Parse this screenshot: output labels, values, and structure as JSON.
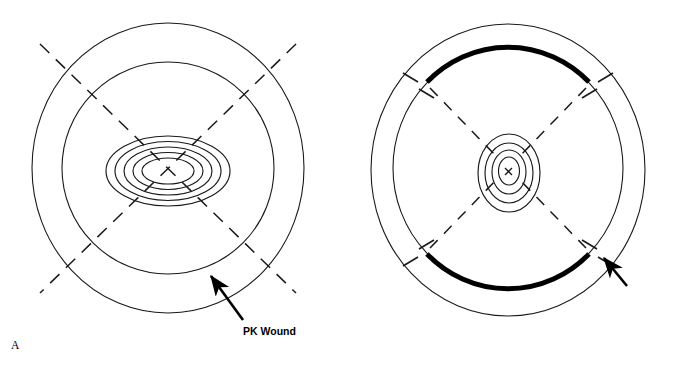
{
  "figure": {
    "width": 682,
    "height": 370,
    "background": "#ffffff",
    "stroke_color": "#1a1a1a",
    "accent_color": "#000000"
  },
  "panels": [
    {
      "id": "A",
      "letter": "A",
      "callout_label": "PK Wound",
      "description": "Target-shaped diagram, oblique view: two large concentric circles with five small concentric ellipses at the center and two long dashed diagonal lines forming an X across the whole target.",
      "center": {
        "x": 168,
        "y": 168
      },
      "outer_circles": [
        {
          "name": "outer-circle",
          "rx": 136,
          "ry": 145
        },
        {
          "name": "inner-circle",
          "rx": 106,
          "ry": 106
        }
      ],
      "center_rings": [
        {
          "rx": 62,
          "ry": 35
        },
        {
          "rx": 53,
          "ry": 29
        },
        {
          "rx": 44,
          "ry": 24
        },
        {
          "rx": 35,
          "ry": 19
        },
        {
          "rx": 26,
          "ry": 14
        }
      ],
      "dashed_lines": 2,
      "arrow": {
        "from": {
          "x": 243,
          "y": 320
        },
        "to": {
          "x": 209,
          "y": 274
        }
      }
    },
    {
      "id": "B",
      "letter": "B",
      "callout_label": "PK\nWound",
      "description": "Target-shaped diagram, face-on view: two large concentric circles with thick black arcs on the inner circle at top and bottom, four small concentric ellipses at the center marked with an x, tick marks on both circles at the four diagonal positions, and dashed radial spokes.",
      "center": {
        "x": 508,
        "y": 168
      },
      "outer_circles": [
        {
          "name": "outer-circle",
          "rx": 137,
          "ry": 145
        },
        {
          "name": "inner-circle",
          "rx": 115,
          "ry": 120
        }
      ],
      "center_rings": [
        {
          "rx": 31,
          "ry": 38
        },
        {
          "rx": 24,
          "ry": 30
        },
        {
          "rx": 17,
          "ry": 22
        },
        {
          "rx": 10,
          "ry": 14
        }
      ],
      "center_marker": "x",
      "thick_arcs": [
        {
          "name": "top-wound-arc",
          "position": "top"
        },
        {
          "name": "bottom-wound-arc",
          "position": "bottom"
        }
      ],
      "tick_marks": 8,
      "dashed_spokes": 4,
      "arrow": {
        "from": {
          "x": 625,
          "y": 285
        },
        "to": {
          "x": 602,
          "y": 256
        }
      }
    }
  ]
}
